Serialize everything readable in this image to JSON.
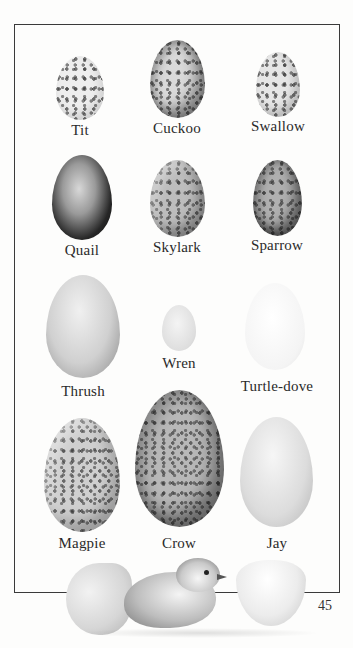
{
  "page": {
    "page_number": "45"
  },
  "eggs": [
    {
      "name": "Tit"
    },
    {
      "name": "Cuckoo"
    },
    {
      "name": "Swallow"
    },
    {
      "name": "Quail"
    },
    {
      "name": "Skylark"
    },
    {
      "name": "Sparrow"
    },
    {
      "name": "Thrush"
    },
    {
      "name": "Wren"
    },
    {
      "name": "Turtle-dove"
    },
    {
      "name": "Magpie"
    },
    {
      "name": "Crow"
    },
    {
      "name": "Jay"
    }
  ],
  "illustration": {
    "description": "Chick hatching from cracked egg beside empty eggshell half"
  }
}
